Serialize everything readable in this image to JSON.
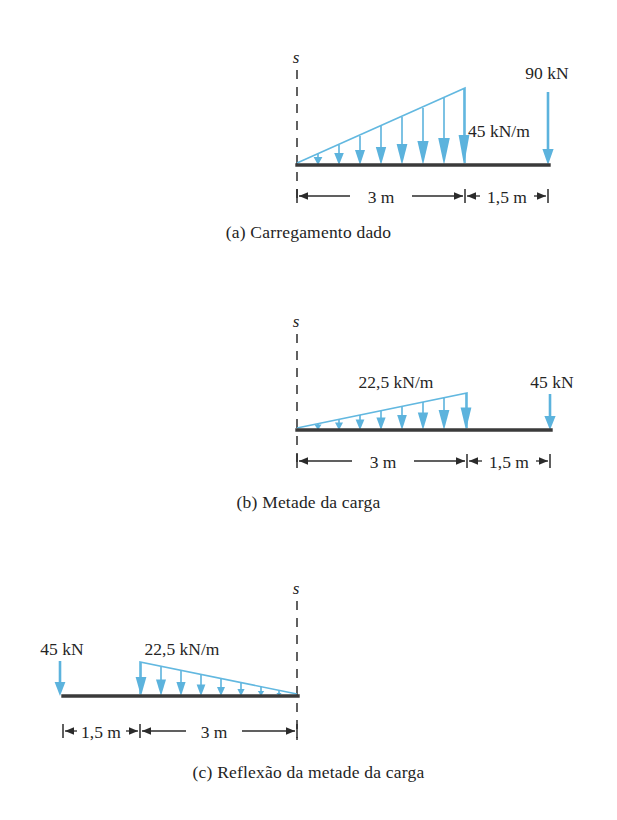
{
  "figure": {
    "colors": {
      "load_arrow": "#5cb3dd",
      "load_outline": "#62b8e0",
      "beam": "#3a3a3a",
      "dimension": "#2b2b2b",
      "text": "#242424"
    },
    "panels": [
      {
        "id": "a",
        "caption": "(a) Carregamento dado",
        "axis_label": "s",
        "distributed_load_label": "45 kN/m",
        "point_load_label": "90 kN",
        "dimensions": [
          "3 m",
          "1,5 m"
        ],
        "load_shape": "triangular-increasing-right",
        "load_peak_value": 45,
        "load_peak_unit": "kN/m",
        "point_load_value": 90,
        "point_load_unit": "kN",
        "span_m": 3,
        "overhang_m": 1.5
      },
      {
        "id": "b",
        "caption": "(b) Metade da carga",
        "axis_label": "s",
        "distributed_load_label": "22,5 kN/m",
        "point_load_label": "45 kN",
        "dimensions": [
          "3 m",
          "1,5 m"
        ],
        "load_shape": "triangular-increasing-right",
        "load_peak_value": 22.5,
        "load_peak_unit": "kN/m",
        "point_load_value": 45,
        "point_load_unit": "kN",
        "span_m": 3,
        "overhang_m": 1.5
      },
      {
        "id": "c",
        "caption": "(c) Reflexão da metade da carga",
        "axis_label": "s",
        "distributed_load_label": "22,5 kN/m",
        "point_load_label": "45 kN",
        "dimensions": [
          "1,5 m",
          "3 m"
        ],
        "load_shape": "triangular-decreasing-right",
        "load_peak_value": 22.5,
        "load_peak_unit": "kN/m",
        "point_load_value": 45,
        "point_load_unit": "kN",
        "span_m": 3,
        "overhang_m": 1.5
      }
    ]
  }
}
